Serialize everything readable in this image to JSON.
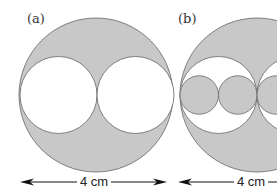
{
  "panels": [
    {
      "label": "(a)",
      "width_label": "4 cm"
    },
    {
      "label": "(b)",
      "width_label": "4 cm"
    }
  ],
  "colors": {
    "shade": "#c8c8c8",
    "stroke": "#666666",
    "arrow": "#111111"
  }
}
